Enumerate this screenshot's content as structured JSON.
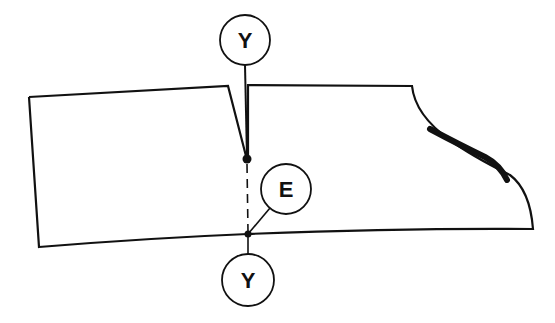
{
  "diagram": {
    "type": "pattern-piece-technical-drawing",
    "stroke_color": "#111111",
    "background": "#ffffff",
    "callouts": [
      {
        "id": "top",
        "label": "Y"
      },
      {
        "id": "middle",
        "label": "E"
      },
      {
        "id": "bottom",
        "label": "Y"
      }
    ],
    "shapes": [
      {
        "name": "left-panel",
        "description": "quadrilateral panel with angled dart edge"
      },
      {
        "name": "right-panel",
        "description": "panel with curved right edge and thick highlighted segment"
      }
    ],
    "markers": [
      {
        "name": "dart-point-dot"
      },
      {
        "name": "seam-junction-dot"
      }
    ]
  }
}
